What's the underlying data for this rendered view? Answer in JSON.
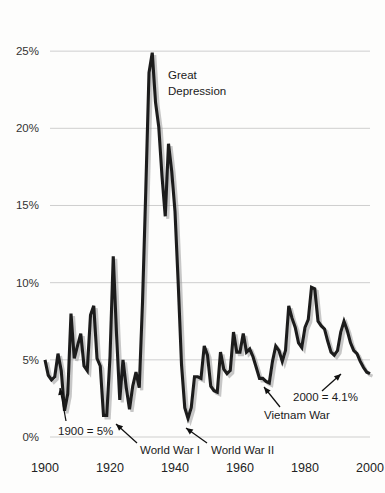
{
  "chart_data": {
    "type": "line",
    "title": "",
    "xlabel": "",
    "ylabel": "",
    "xlim": [
      1900,
      2000
    ],
    "ylim": [
      0,
      26.5
    ],
    "grid": true,
    "legend": "none",
    "x_ticks": [
      "1900",
      "1920",
      "1940",
      "1960",
      "1980",
      "2000"
    ],
    "x_tick_values": [
      1900,
      1920,
      1940,
      1960,
      1980,
      2000
    ],
    "y_ticks": [
      "0%",
      "5%",
      "10%",
      "15%",
      "20%",
      "25%"
    ],
    "y_tick_values": [
      0,
      5,
      10,
      15,
      20,
      25
    ],
    "series": [
      {
        "name": "Unemployment rate",
        "color": "#1c1c1c",
        "x": [
          1900,
          1901,
          1902,
          1903,
          1904,
          1905,
          1906,
          1907,
          1908,
          1909,
          1910,
          1911,
          1912,
          1913,
          1914,
          1915,
          1916,
          1917,
          1918,
          1919,
          1920,
          1921,
          1922,
          1923,
          1924,
          1925,
          1926,
          1927,
          1928,
          1929,
          1930,
          1931,
          1932,
          1933,
          1934,
          1935,
          1936,
          1937,
          1938,
          1939,
          1940,
          1941,
          1942,
          1943,
          1944,
          1945,
          1946,
          1947,
          1948,
          1949,
          1950,
          1951,
          1952,
          1953,
          1954,
          1955,
          1956,
          1957,
          1958,
          1959,
          1960,
          1961,
          1962,
          1963,
          1964,
          1965,
          1966,
          1967,
          1968,
          1969,
          1970,
          1971,
          1972,
          1973,
          1974,
          1975,
          1976,
          1977,
          1978,
          1979,
          1980,
          1981,
          1982,
          1983,
          1984,
          1985,
          1986,
          1987,
          1988,
          1989,
          1990,
          1991,
          1992,
          1993,
          1994,
          1995,
          1996,
          1997,
          1998,
          1999,
          2000
        ],
        "values": [
          5.0,
          4.0,
          3.7,
          3.9,
          5.4,
          4.3,
          1.7,
          2.8,
          8.0,
          5.1,
          5.9,
          6.7,
          4.6,
          4.3,
          7.9,
          8.5,
          5.1,
          4.6,
          1.4,
          1.4,
          5.2,
          11.7,
          6.7,
          2.4,
          5.0,
          3.2,
          1.8,
          3.3,
          4.2,
          3.2,
          8.7,
          15.9,
          23.6,
          24.9,
          21.7,
          20.1,
          16.9,
          14.3,
          19.0,
          17.2,
          14.6,
          9.9,
          4.7,
          1.9,
          1.2,
          1.9,
          3.9,
          3.9,
          3.8,
          5.9,
          5.3,
          3.3,
          3.0,
          2.9,
          5.5,
          4.4,
          4.1,
          4.3,
          6.8,
          5.5,
          5.5,
          6.7,
          5.5,
          5.7,
          5.2,
          4.5,
          3.8,
          3.8,
          3.6,
          3.5,
          4.9,
          5.9,
          5.6,
          4.9,
          5.6,
          8.5,
          7.7,
          7.1,
          6.1,
          5.8,
          7.1,
          7.6,
          9.7,
          9.6,
          7.5,
          7.2,
          7.0,
          6.2,
          5.5,
          5.3,
          5.6,
          6.8,
          7.5,
          6.9,
          6.1,
          5.6,
          5.4,
          4.9,
          4.5,
          4.2,
          4.1
        ]
      }
    ],
    "annotations": [
      {
        "id": "great-depression",
        "text_line1": "Great",
        "text_line2": "Depression",
        "x": 1931,
        "y": 23.0
      },
      {
        "id": "first-point",
        "text": "1900 = 5%",
        "x": 1900,
        "y": 5.0
      },
      {
        "id": "world-war-1",
        "text": "World War I",
        "x": 1918,
        "y": 1.4
      },
      {
        "id": "world-war-2",
        "text": "World War II",
        "x": 1944,
        "y": 1.2
      },
      {
        "id": "vietnam-war",
        "text": "Vietnam War",
        "x": 1968,
        "y": 3.6
      },
      {
        "id": "last-point",
        "text": "2000 = 4.1%",
        "x": 2000,
        "y": 4.1
      }
    ]
  },
  "style": {
    "line_color": "#1c1c1c",
    "shadow_color": "#9a9a9a",
    "grid_color": "#c9c9c9",
    "background": "#fdfdfc",
    "text_color": "#1a1a1a"
  }
}
